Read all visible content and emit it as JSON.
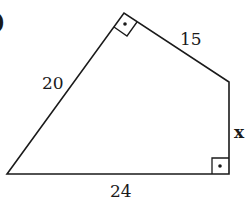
{
  "figure": {
    "type": "quadrilateral",
    "vertices": {
      "bottom_left": [
        7,
        174
      ],
      "top": [
        124,
        13
      ],
      "right_top": [
        229,
        82
      ],
      "right_bottom": [
        229,
        174
      ]
    },
    "sides": {
      "left": "20",
      "top_right": "15",
      "right": "x",
      "bottom": "24"
    },
    "right_angles": [
      "top",
      "right_bottom"
    ],
    "partial_label": ")"
  }
}
